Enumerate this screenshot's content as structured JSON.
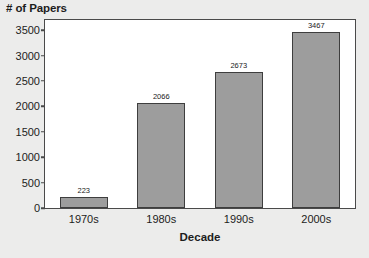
{
  "chart_data": {
    "type": "bar",
    "title": "",
    "categories": [
      "1970s",
      "1980s",
      "1990s",
      "2000s"
    ],
    "values": [
      223,
      2066,
      2673,
      3467
    ],
    "value_labels": [
      "223",
      "2066",
      "2673",
      "3467"
    ],
    "xlabel": "Decade",
    "ylabel": "# of Papers",
    "ylim": [
      0,
      3700
    ],
    "yticks": [
      0,
      500,
      1000,
      1500,
      2000,
      2500,
      3000,
      3500
    ],
    "ytick_labels": [
      "0",
      "500",
      "1000",
      "1500",
      "2000",
      "2500",
      "3000",
      "3500"
    ],
    "grid": false,
    "legend": null,
    "series": [
      {
        "name": "# of Papers",
        "values": [
          223,
          2066,
          2673,
          3467
        ]
      }
    ],
    "colors": {
      "bar_fill": "#9d9d9d",
      "bar_edge": "#3e3e3e",
      "plot_background": "#ffffff",
      "figure_background": "#ececeb",
      "axis": "#4a4a4a",
      "text": "#1c1c1c"
    }
  }
}
